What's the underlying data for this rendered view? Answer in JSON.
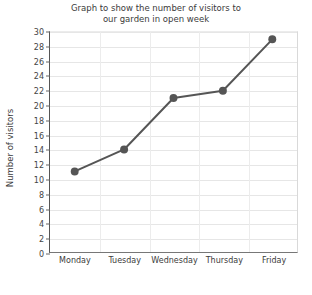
{
  "chart_data": {
    "type": "line",
    "title": "Graph to show the number of visitors to\nour garden in open week",
    "title_lines": [
      "Graph to show the number of visitors to",
      "our garden in open week"
    ],
    "xlabel": "",
    "ylabel": "Number of visitors",
    "categories": [
      "Monday",
      "Tuesday",
      "Wednesday",
      "Thursday",
      "Friday"
    ],
    "values": [
      11,
      14,
      21,
      22,
      29
    ],
    "ylim": [
      0,
      30
    ],
    "ytick_step": 2,
    "yticks": [
      0,
      2,
      4,
      6,
      8,
      10,
      12,
      14,
      16,
      18,
      20,
      22,
      24,
      26,
      28,
      30
    ],
    "grid": true,
    "legend": null,
    "series_color": "#555555",
    "marker": "circle",
    "marker_size": 5,
    "line_width": 2
  },
  "colors": {
    "line": "#555555",
    "marker": "#555555",
    "grid": "#e6e6e6",
    "axis": "#666666",
    "text": "#3b3b3b",
    "background": "#ffffff"
  }
}
